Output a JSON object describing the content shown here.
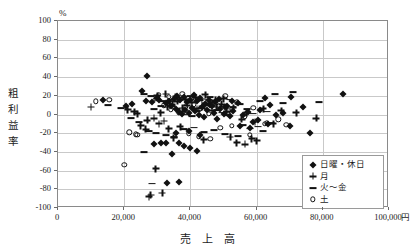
{
  "chart_data": {
    "type": "scatter",
    "title": "",
    "xlabel": "売 上 高",
    "ylabel": "粗利益率",
    "y_unit": "%",
    "x_unit": "円",
    "xlim": [
      0,
      100000
    ],
    "ylim": [
      -100,
      100
    ],
    "x_ticks": [
      "0",
      "20,000",
      "40,000",
      "60,000",
      "80,000",
      "100,000"
    ],
    "x_tick_values": [
      0,
      20000,
      40000,
      60000,
      80000,
      100000
    ],
    "y_ticks": [
      "100",
      "80",
      "60",
      "40",
      "20",
      "0",
      "-20",
      "-40",
      "-60",
      "-80",
      "-100"
    ],
    "y_tick_values": [
      100,
      80,
      60,
      40,
      20,
      0,
      -20,
      -40,
      -60,
      -80,
      -100
    ],
    "grid": "horizontal-and-vertical",
    "legend_position": "bottom-right",
    "marker_color": "#111111",
    "series": [
      {
        "name": "日曜・休日",
        "marker": "filled-diamond",
        "points": [
          [
            13500,
            15
          ],
          [
            27000,
            41
          ],
          [
            25500,
            25
          ],
          [
            30000,
            18
          ],
          [
            32500,
            12
          ],
          [
            34000,
            9
          ],
          [
            35500,
            6
          ],
          [
            36500,
            3
          ],
          [
            37500,
            1
          ],
          [
            38500,
            5
          ],
          [
            39500,
            2
          ],
          [
            40500,
            7
          ],
          [
            41500,
            4
          ],
          [
            42500,
            0
          ],
          [
            43500,
            8
          ],
          [
            44000,
            -3
          ],
          [
            45000,
            5
          ],
          [
            46000,
            10
          ],
          [
            47000,
            2
          ],
          [
            48000,
            -5
          ],
          [
            49000,
            6
          ],
          [
            50000,
            1
          ],
          [
            51000,
            9
          ],
          [
            52000,
            -2
          ],
          [
            53000,
            4
          ],
          [
            54500,
            12
          ],
          [
            56000,
            0
          ],
          [
            57500,
            3
          ],
          [
            59000,
            -8
          ],
          [
            61000,
            5
          ],
          [
            62500,
            18
          ],
          [
            64000,
            10
          ],
          [
            66000,
            -1
          ],
          [
            68000,
            2
          ],
          [
            70500,
            19
          ],
          [
            74000,
            8
          ],
          [
            86000,
            22
          ],
          [
            29000,
            -32
          ],
          [
            31000,
            -30
          ],
          [
            32500,
            -31
          ],
          [
            36500,
            -30
          ],
          [
            38000,
            -34
          ],
          [
            40000,
            -36
          ],
          [
            34500,
            -42
          ],
          [
            42000,
            -39
          ],
          [
            33000,
            -73
          ],
          [
            36500,
            -72
          ],
          [
            70000,
            -12
          ],
          [
            76000,
            -20
          ],
          [
            26500,
            14
          ],
          [
            28500,
            13
          ],
          [
            30500,
            16
          ],
          [
            22500,
            11
          ],
          [
            20500,
            9
          ],
          [
            33500,
            14
          ],
          [
            35000,
            17
          ],
          [
            36000,
            20
          ],
          [
            37000,
            15
          ],
          [
            38000,
            19
          ],
          [
            39000,
            13
          ],
          [
            40000,
            16
          ],
          [
            41000,
            21
          ],
          [
            42000,
            14
          ],
          [
            43000,
            18
          ],
          [
            44500,
            11
          ],
          [
            45500,
            15
          ],
          [
            46500,
            9
          ],
          [
            47500,
            13
          ],
          [
            48500,
            17
          ],
          [
            50500,
            8
          ],
          [
            52500,
            14
          ],
          [
            55000,
            -12
          ],
          [
            58000,
            -14
          ],
          [
            60500,
            -6
          ],
          [
            63500,
            -10
          ],
          [
            35500,
            -20
          ],
          [
            39500,
            -18
          ],
          [
            43000,
            -22
          ]
        ]
      },
      {
        "name": "月",
        "marker": "plus",
        "points": [
          [
            10000,
            8
          ],
          [
            24000,
            1
          ],
          [
            31000,
            2
          ],
          [
            33000,
            8
          ],
          [
            34500,
            11
          ],
          [
            36000,
            14
          ],
          [
            37500,
            7
          ],
          [
            39000,
            10
          ],
          [
            40500,
            13
          ],
          [
            42000,
            6
          ],
          [
            43500,
            9
          ],
          [
            45000,
            12
          ],
          [
            46500,
            4
          ],
          [
            48000,
            8
          ],
          [
            49500,
            11
          ],
          [
            51000,
            3
          ],
          [
            53000,
            7
          ],
          [
            55500,
            -5
          ],
          [
            57000,
            2
          ],
          [
            59500,
            -8
          ],
          [
            62000,
            6
          ],
          [
            65000,
            -10
          ],
          [
            67500,
            4
          ],
          [
            72000,
            2
          ],
          [
            78000,
            -4
          ],
          [
            27000,
            -6
          ],
          [
            29000,
            -4
          ],
          [
            30500,
            -10
          ],
          [
            32000,
            -7
          ],
          [
            25000,
            -12
          ],
          [
            26500,
            -16
          ],
          [
            33500,
            -15
          ],
          [
            37000,
            -13
          ],
          [
            28000,
            -86
          ],
          [
            31500,
            -84
          ],
          [
            27500,
            -88
          ],
          [
            29500,
            -58
          ],
          [
            35000,
            -25
          ],
          [
            44000,
            -27
          ],
          [
            52000,
            -24
          ],
          [
            58500,
            -26
          ],
          [
            30000,
            20
          ],
          [
            32500,
            22
          ],
          [
            35500,
            19
          ],
          [
            38500,
            16
          ],
          [
            41500,
            18
          ],
          [
            44500,
            21
          ],
          [
            47500,
            15
          ],
          [
            50000,
            17
          ],
          [
            23000,
            3
          ],
          [
            21000,
            5
          ],
          [
            54000,
            -30
          ],
          [
            56500,
            -32
          ],
          [
            60000,
            -28
          ]
        ]
      },
      {
        "name": "火～金",
        "marker": "dash",
        "points": [
          [
            15000,
            10
          ],
          [
            19000,
            7
          ],
          [
            26000,
            22
          ],
          [
            28000,
            20
          ],
          [
            30000,
            17
          ],
          [
            31500,
            14
          ],
          [
            33000,
            12
          ],
          [
            34500,
            9
          ],
          [
            36000,
            6
          ],
          [
            37500,
            3
          ],
          [
            39000,
            0
          ],
          [
            40500,
            -2
          ],
          [
            42000,
            4
          ],
          [
            43500,
            7
          ],
          [
            45000,
            10
          ],
          [
            46500,
            13
          ],
          [
            48000,
            5
          ],
          [
            49500,
            2
          ],
          [
            51000,
            -1
          ],
          [
            53000,
            8
          ],
          [
            55000,
            11
          ],
          [
            57000,
            6
          ],
          [
            59000,
            1
          ],
          [
            61000,
            14
          ],
          [
            63000,
            3
          ],
          [
            65500,
            22
          ],
          [
            68000,
            12
          ],
          [
            71000,
            24
          ],
          [
            79000,
            13
          ],
          [
            22000,
            -4
          ],
          [
            24500,
            -8
          ],
          [
            27500,
            -18
          ],
          [
            29500,
            -20
          ],
          [
            32500,
            -22
          ],
          [
            35000,
            -24
          ],
          [
            26000,
            -40
          ],
          [
            28500,
            -74
          ],
          [
            38000,
            -16
          ],
          [
            41000,
            -14
          ],
          [
            44000,
            -19
          ],
          [
            47000,
            -17
          ],
          [
            50500,
            -21
          ],
          [
            54500,
            -23
          ],
          [
            58000,
            -15
          ],
          [
            62000,
            -18
          ],
          [
            29000,
            6
          ],
          [
            31000,
            9
          ],
          [
            34000,
            16
          ],
          [
            37000,
            18
          ],
          [
            40000,
            20
          ],
          [
            43000,
            15
          ],
          [
            46000,
            19
          ],
          [
            52000,
            16
          ],
          [
            56000,
            -11
          ],
          [
            60500,
            -13
          ],
          [
            64500,
            -9
          ]
        ]
      },
      {
        "name": "土",
        "marker": "open-circle",
        "points": [
          [
            11500,
            14
          ],
          [
            15500,
            16
          ],
          [
            29500,
            17
          ],
          [
            32000,
            10
          ],
          [
            34000,
            5
          ],
          [
            36500,
            2
          ],
          [
            38500,
            8
          ],
          [
            41000,
            11
          ],
          [
            43000,
            6
          ],
          [
            45500,
            1
          ],
          [
            48500,
            9
          ],
          [
            51500,
            4
          ],
          [
            54000,
            13
          ],
          [
            56500,
            -2
          ],
          [
            59000,
            7
          ],
          [
            62500,
            -10
          ],
          [
            66500,
            -5
          ],
          [
            21500,
            -19
          ],
          [
            23500,
            -21
          ],
          [
            20000,
            -54
          ],
          [
            24000,
            -22
          ],
          [
            39500,
            -20
          ],
          [
            42500,
            -24
          ],
          [
            46000,
            -26
          ],
          [
            49000,
            -14
          ],
          [
            52500,
            -12
          ],
          [
            58000,
            -22
          ],
          [
            63000,
            -9
          ],
          [
            69000,
            -11
          ],
          [
            30500,
            21
          ],
          [
            33500,
            19
          ],
          [
            37500,
            22
          ],
          [
            40500,
            17
          ],
          [
            44000,
            14
          ],
          [
            47500,
            12
          ],
          [
            50500,
            20
          ]
        ]
      }
    ]
  },
  "legend": {
    "items": [
      {
        "label": "日曜・休日",
        "marker": "filled-diamond"
      },
      {
        "label": "月",
        "marker": "plus"
      },
      {
        "label": "火～金",
        "marker": "dash"
      },
      {
        "label": "土",
        "marker": "open-circle"
      }
    ]
  },
  "axes": {
    "y_title_chars": [
      "粗",
      "利",
      "益",
      "率"
    ],
    "y_unit_label": "%",
    "x_title": "売 上 高",
    "x_unit_label": "円"
  }
}
